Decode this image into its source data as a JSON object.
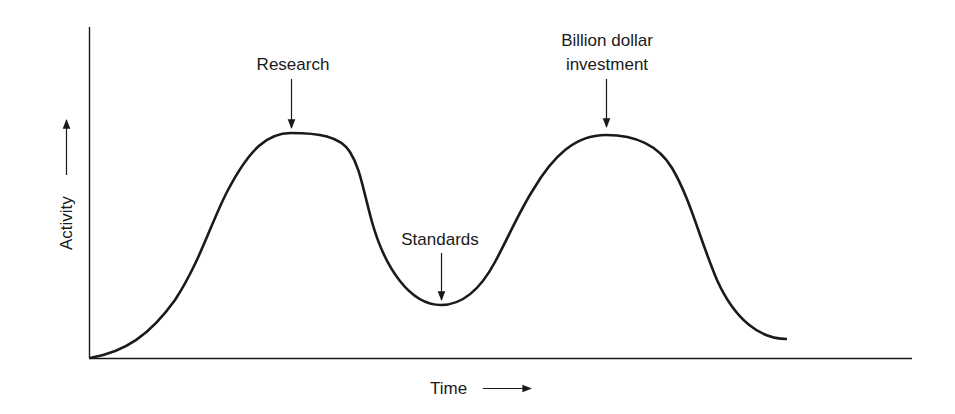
{
  "diagram": {
    "type": "curve-annotation",
    "axes": {
      "y_label": "Activity",
      "x_label": "Time"
    },
    "annotations": [
      {
        "id": "research",
        "lines": [
          "Research"
        ],
        "points_to": "first peak"
      },
      {
        "id": "standards",
        "lines": [
          "Standards"
        ],
        "points_to": "trough"
      },
      {
        "id": "investment",
        "lines": [
          "Billion dollar",
          "investment"
        ],
        "points_to": "second peak"
      }
    ],
    "curve_points": [
      [
        90,
        358
      ],
      [
        150,
        330
      ],
      [
        200,
        270
      ],
      [
        230,
        195
      ],
      [
        255,
        155
      ],
      [
        291,
        133
      ],
      [
        330,
        136
      ],
      [
        350,
        155
      ],
      [
        365,
        195
      ],
      [
        385,
        250
      ],
      [
        410,
        290
      ],
      [
        441,
        305
      ],
      [
        470,
        295
      ],
      [
        495,
        260
      ],
      [
        520,
        200
      ],
      [
        545,
        155
      ],
      [
        606,
        135
      ],
      [
        655,
        150
      ],
      [
        680,
        185
      ],
      [
        700,
        235
      ],
      [
        720,
        285
      ],
      [
        750,
        325
      ],
      [
        787,
        339
      ]
    ]
  }
}
